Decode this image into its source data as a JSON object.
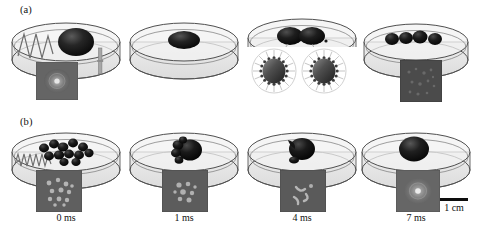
{
  "figure": {
    "panels": [
      {
        "id": "a",
        "label": "(a)",
        "row_index": 0,
        "frames": [
          {
            "name": "frame-a1",
            "time_label": "",
            "droplet_count": 1,
            "droplet_description": "single large dark droplet in Petri dish",
            "has_acoustic_wave": true,
            "acoustic_wave_type": "sharp-zigzag",
            "has_needle": true,
            "has_inset": true,
            "inset_description": "grayscale top-view photograph of single droplet"
          },
          {
            "name": "frame-a2",
            "time_label": "",
            "droplet_count": 1,
            "droplet_description": "single flattened dark droplet centered in dish",
            "has_acoustic_wave": false,
            "acoustic_wave_type": "",
            "has_needle": false,
            "has_inset": false,
            "inset_description": ""
          },
          {
            "name": "frame-a3",
            "time_label": "",
            "droplet_count": 2,
            "droplet_description": "two dark droplets with magnified surfactant-coated micelle callouts",
            "has_acoustic_wave": false,
            "acoustic_wave_type": "",
            "has_needle": false,
            "has_inset": false,
            "inset_description": "",
            "has_callout": true,
            "callout_description": "two magnified droplets encircled by surfactant molecules"
          },
          {
            "name": "frame-a4",
            "time_label": "",
            "droplet_count": 4,
            "droplet_description": "four small dark droplets in a row",
            "has_acoustic_wave": false,
            "acoustic_wave_type": "",
            "has_needle": false,
            "has_inset": true,
            "inset_description": "dark grayscale top-view photograph of dispersed droplets"
          }
        ]
      },
      {
        "id": "b",
        "label": "(b)",
        "row_index": 1,
        "frames": [
          {
            "name": "frame-b1",
            "time_label": "0 ms",
            "droplet_count": 12,
            "droplet_description": "many small dark droplets scattered across the dish",
            "has_acoustic_wave": true,
            "acoustic_wave_type": "tight-zigzag",
            "has_needle": false,
            "has_inset": true,
            "inset_description": "grayscale top-view photograph of many dispersed droplets"
          },
          {
            "name": "frame-b2",
            "time_label": "1 ms",
            "droplet_count": 5,
            "droplet_description": "droplets merging into a compact cluster",
            "has_acoustic_wave": false,
            "acoustic_wave_type": "",
            "has_needle": false,
            "has_inset": true,
            "inset_description": "grayscale top-view photograph of merging droplets"
          },
          {
            "name": "frame-b3",
            "time_label": "4 ms",
            "droplet_count": 3,
            "droplet_description": "mostly coalesced droplet with small satellites",
            "has_acoustic_wave": false,
            "acoustic_wave_type": "",
            "has_needle": false,
            "has_inset": true,
            "inset_description": "grayscale top-view photograph of nearly merged droplet"
          },
          {
            "name": "frame-b4",
            "time_label": "7 ms",
            "droplet_count": 1,
            "droplet_description": "single large coalesced droplet",
            "has_acoustic_wave": false,
            "acoustic_wave_type": "",
            "has_needle": false,
            "has_inset": true,
            "inset_description": "grayscale top-view photograph of single merged droplet"
          }
        ]
      }
    ],
    "scale_bar": {
      "label": "1 cm",
      "bar_length_px": 28
    },
    "caption_fragment": "",
    "colors": {
      "droplet_dark": "#171717",
      "droplet_mid": "#3a3a3a",
      "dish_fill": "#e9e9e9",
      "dish_outline": "#5a5a5a",
      "wave_stroke": "#6b6b6b",
      "inset_frame": "#6f6f6f",
      "text": "#111111",
      "scale_bar": "#0d0d0d"
    }
  }
}
